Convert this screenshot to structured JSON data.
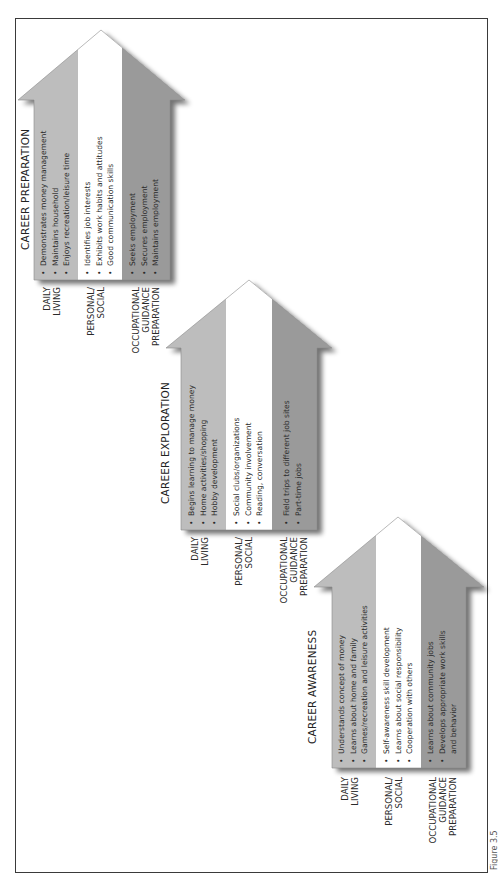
{
  "figure": {
    "caption": "Figure 3.5",
    "colors": {
      "daily_living_band": "#bdbdbd",
      "personal_social_band": "#ffffff",
      "occupational_band": "#9a9a9a",
      "border": "#3a3a3a",
      "text": "#222222"
    },
    "row_labels": {
      "daily_living": "DAILY\nLIVING",
      "personal_social": "PERSONAL/\nSOCIAL",
      "occupational": "OCCUPATIONAL\nGUIDANCE\nPREPARATION"
    },
    "stages": [
      {
        "title": "CAREER AWARENESS",
        "daily_living": [
          "Understands concept of money",
          "Learns about home and family",
          "Games/recreation and leisure activities"
        ],
        "personal_social": [
          "Self-awareness skill development",
          "Learns about social responsibility",
          "Cooperation with others"
        ],
        "occupational": [
          "Learns about community jobs",
          "Develops appropriate work skills and behavior"
        ]
      },
      {
        "title": "CAREER EXPLORATION",
        "daily_living": [
          "Begins learning to manage money",
          "Home activities/shopping",
          "Hobby development"
        ],
        "personal_social": [
          "Social clubs/organizations",
          "Community involvement",
          "Reading, conversation"
        ],
        "occupational": [
          "Field trips to different job sites",
          "Part-time jobs"
        ]
      },
      {
        "title": "CAREER PREPARATION",
        "daily_living": [
          "Demonstrates money management",
          "Maintains household",
          "Enjoys recreation/leisure time"
        ],
        "personal_social": [
          "Identifies job interests",
          "Exhibits work habits and attitudes",
          "Good communication skills"
        ],
        "occupational": [
          "Seeks employment",
          "Secures employment",
          "Maintains employment"
        ]
      }
    ]
  }
}
